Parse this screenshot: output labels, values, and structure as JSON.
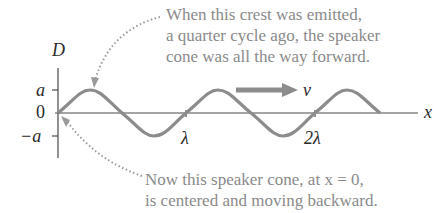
{
  "diagram": {
    "axis": {
      "y_label": "D",
      "x_label": "x",
      "y_ticks": [
        {
          "label": "a",
          "value": 1
        },
        {
          "label": "0",
          "value": 0
        },
        {
          "label": "−a",
          "value": -1
        }
      ],
      "x_ticks": [
        {
          "label": "λ",
          "value": 1
        },
        {
          "label": "2λ",
          "value": 2
        }
      ]
    },
    "velocity_label": "v",
    "annotations": {
      "top": [
        "When this crest was emitted,",
        "a quarter cycle ago, the speaker",
        "cone was all the way forward."
      ],
      "bottom": [
        "Now this speaker cone, at x = 0,",
        "is centered and moving backward."
      ]
    },
    "colors": {
      "wave": "#8c8c8c",
      "axis": "#4a4a4a",
      "arrow": "#8c8c8c",
      "dotted": "#9a9a9a",
      "caption": "#8a8a8a"
    }
  }
}
